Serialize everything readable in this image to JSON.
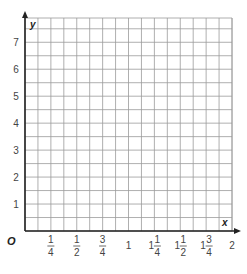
{
  "chart_data": {
    "type": "line",
    "title": "",
    "xlabel": "x",
    "ylabel": "y",
    "origin_label": "O",
    "xlim": [
      0,
      2
    ],
    "ylim": [
      0,
      7.9
    ],
    "grid": true,
    "grid_x_step": 0.125,
    "grid_y_step": 0.5,
    "x_ticks": [
      {
        "value": 0.25,
        "whole": "",
        "num": "1",
        "den": "4"
      },
      {
        "value": 0.5,
        "whole": "",
        "num": "1",
        "den": "2"
      },
      {
        "value": 0.75,
        "whole": "",
        "num": "3",
        "den": "4"
      },
      {
        "value": 1,
        "whole": "1",
        "num": "",
        "den": ""
      },
      {
        "value": 1.25,
        "whole": "1",
        "num": "1",
        "den": "4"
      },
      {
        "value": 1.5,
        "whole": "1",
        "num": "1",
        "den": "2"
      },
      {
        "value": 1.75,
        "whole": "1",
        "num": "3",
        "den": "4"
      },
      {
        "value": 2,
        "whole": "2",
        "num": "",
        "den": ""
      }
    ],
    "y_ticks": [
      1,
      2,
      3,
      4,
      5,
      6,
      7
    ],
    "series": [],
    "colors": {
      "grid": "#9a9a9a",
      "axis": "#222222",
      "text": "#444444"
    }
  }
}
